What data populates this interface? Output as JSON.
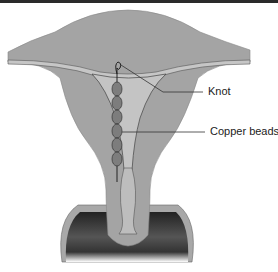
{
  "figure": {
    "labels": {
      "knot": "Knot",
      "beads": "Copper beads"
    },
    "bead_count": 6,
    "colors": {
      "tissue": "#a4a4a4",
      "cavity": "#c4c4c4",
      "bead": "#808080",
      "outline": "#3a3a3a",
      "vagina_dark": "#1e1e1e"
    }
  }
}
